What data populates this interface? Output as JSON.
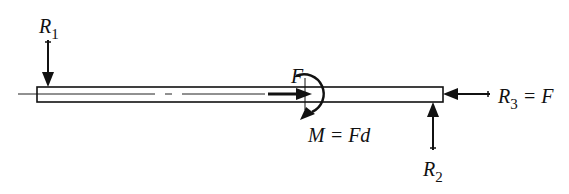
{
  "diagram": {
    "type": "free-body diagram of a bar",
    "labels": {
      "r1": {
        "sym": "R",
        "sub": "1"
      },
      "r2": {
        "sym": "R",
        "sub": "2"
      },
      "r3": {
        "sym": "R",
        "sub": "3",
        "rest": " = F"
      },
      "force": "F",
      "moment": "M = Fd"
    },
    "colors": {
      "ink": "#111111",
      "background": "#ffffff"
    }
  }
}
